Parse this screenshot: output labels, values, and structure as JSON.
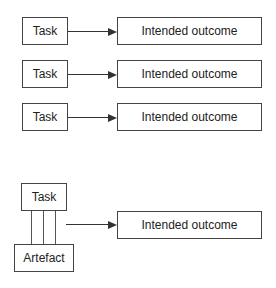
{
  "diagram": {
    "rows": [
      {
        "task": "Task",
        "outcome": "Intended outcome"
      },
      {
        "task": "Task",
        "outcome": "Intended outcome"
      },
      {
        "task": "Task",
        "outcome": "Intended outcome"
      }
    ],
    "combined": {
      "task": "Task",
      "artefact": "Artefact",
      "outcome": "Intended outcome",
      "connector_lines": 3
    },
    "colors": {
      "stroke": "#444444",
      "background": "#ffffff",
      "text": "#222222"
    }
  }
}
